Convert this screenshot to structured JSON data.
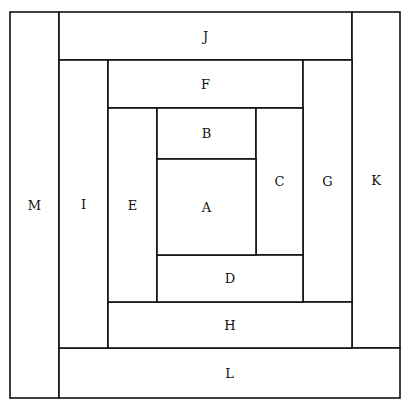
{
  "diagram": {
    "type": "log-cabin-quilt-block",
    "line_color": "#111111",
    "background": "#ffffff",
    "blocks": [
      {
        "label": "M",
        "x": 10,
        "y": 12,
        "w": 49,
        "h": 386
      },
      {
        "label": "J",
        "x": 59,
        "y": 12,
        "w": 293,
        "h": 48
      },
      {
        "label": "K",
        "x": 352,
        "y": 12,
        "w": 48,
        "h": 336
      },
      {
        "label": "L",
        "x": 59,
        "y": 348,
        "w": 341,
        "h": 50
      },
      {
        "label": "I",
        "x": 59,
        "y": 60,
        "w": 49,
        "h": 288
      },
      {
        "label": "F",
        "x": 108,
        "y": 60,
        "w": 195,
        "h": 48
      },
      {
        "label": "G",
        "x": 303,
        "y": 60,
        "w": 49,
        "h": 242
      },
      {
        "label": "H",
        "x": 108,
        "y": 302,
        "w": 244,
        "h": 46
      },
      {
        "label": "E",
        "x": 108,
        "y": 108,
        "w": 49,
        "h": 194
      },
      {
        "label": "B",
        "x": 157,
        "y": 108,
        "w": 99,
        "h": 51
      },
      {
        "label": "C",
        "x": 256,
        "y": 108,
        "w": 47,
        "h": 147
      },
      {
        "label": "D",
        "x": 157,
        "y": 255,
        "w": 146,
        "h": 47
      },
      {
        "label": "A",
        "x": 157,
        "y": 159,
        "w": 99,
        "h": 96
      }
    ]
  }
}
